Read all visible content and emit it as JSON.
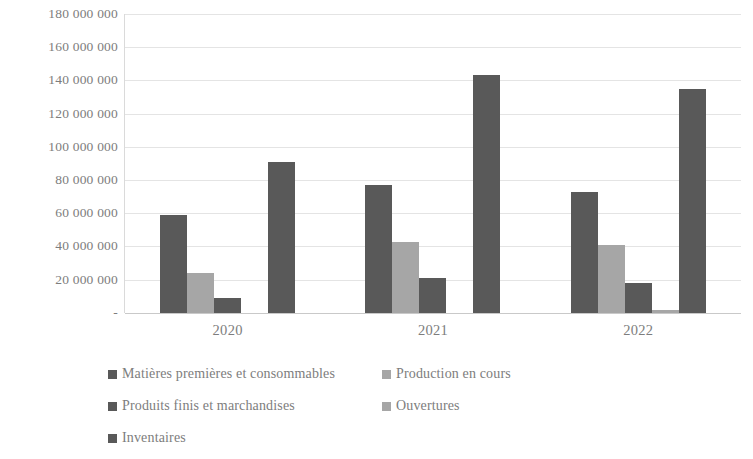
{
  "chart_data": {
    "type": "bar",
    "title": "",
    "subtitle": "",
    "xlabel": "",
    "ylabel": "",
    "categories": [
      "2020",
      "2021",
      "2022"
    ],
    "ylim": [
      0,
      180000000
    ],
    "y_tick_values": [
      0,
      20000000,
      40000000,
      60000000,
      80000000,
      100000000,
      120000000,
      140000000,
      160000000,
      180000000
    ],
    "y_tick_labels": [
      "-",
      "20 000 000",
      "40 000 000",
      "60 000 000",
      "80 000 000",
      "100 000 000",
      "120 000 000",
      "140 000 000",
      "160 000 000",
      "180 000 000"
    ],
    "grid": true,
    "legend_position": "bottom-left",
    "series": [
      {
        "name": "Matières premières et consommables",
        "color": "#595959",
        "values": [
          59000000,
          77000000,
          73000000
        ]
      },
      {
        "name": "Production en cours",
        "color": "#a6a6a6",
        "values": [
          24000000,
          43000000,
          41000000
        ]
      },
      {
        "name": "Produits finis et marchandises",
        "color": "#595959",
        "values": [
          9000000,
          21000000,
          18000000
        ]
      },
      {
        "name": "Ouvertures",
        "color": "#a6a6a6",
        "values": [
          0,
          0,
          2000000
        ]
      },
      {
        "name": "Inventaires",
        "color": "#595959",
        "values": [
          91000000,
          143000000,
          135000000
        ]
      }
    ]
  },
  "axis": {
    "y_ticks": [
      {
        "label": "180 000 000",
        "value": 180000000
      },
      {
        "label": "160 000 000",
        "value": 160000000
      },
      {
        "label": "140 000 000",
        "value": 140000000
      },
      {
        "label": "120 000 000",
        "value": 120000000
      },
      {
        "label": "100 000 000",
        "value": 100000000
      },
      {
        "label": "80 000 000",
        "value": 80000000
      },
      {
        "label": "60 000 000",
        "value": 60000000
      },
      {
        "label": "40 000 000",
        "value": 40000000
      },
      {
        "label": "20 000 000",
        "value": 20000000
      },
      {
        "label": "-",
        "value": 0
      }
    ],
    "x_ticks": [
      "2020",
      "2021",
      "2022"
    ]
  },
  "legend": {
    "rows": [
      [
        {
          "label": "Matières premières et consommables",
          "color": "#595959"
        },
        {
          "label": "Production en cours",
          "color": "#a6a6a6"
        }
      ],
      [
        {
          "label": "Produits finis et marchandises",
          "color": "#595959"
        },
        {
          "label": "Ouvertures",
          "color": "#a6a6a6"
        }
      ],
      [
        {
          "label": "Inventaires",
          "color": "#595959"
        }
      ]
    ]
  },
  "colors": {
    "dark": "#595959",
    "light": "#a6a6a6",
    "gridline": "#e4e4e4",
    "text": "#7d7d7d",
    "background": "#ffffff"
  }
}
